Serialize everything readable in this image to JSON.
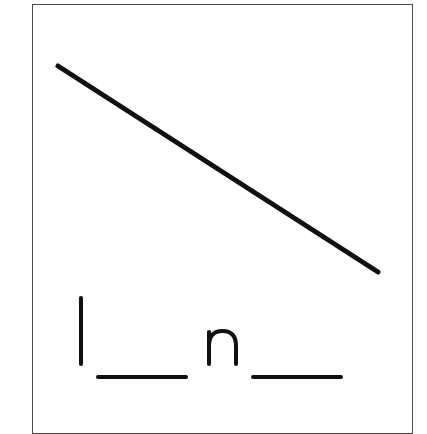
{
  "worksheet": {
    "description": "Phonics fill-in-the-blank card with a diagonal line picture",
    "picture": {
      "name": "line",
      "stroke_color": "#111111",
      "start": [
        58,
        66
      ],
      "end": [
        378,
        272
      ]
    },
    "word_puzzle": {
      "letters": [
        "l",
        "n"
      ],
      "blanks": 2,
      "pattern": "l _ n _",
      "answer_hint": "line"
    },
    "colors": {
      "border": "#4a4a4a",
      "ink": "#111111",
      "background": "#ffffff"
    }
  }
}
